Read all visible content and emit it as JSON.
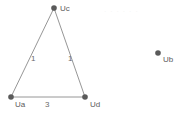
{
  "canvas": {
    "width": 188,
    "height": 117,
    "background_color": "#ffffff"
  },
  "diagram": {
    "title": "",
    "node_color": "#5a5a5a",
    "edge_color": "#8a8a8a",
    "label_color": "#5b5b5b",
    "nodes": [
      {
        "id": "Uc",
        "label": "Uc",
        "x": 54,
        "y": 8,
        "label_dx": 6,
        "label_dy": -4
      },
      {
        "id": "Ua",
        "label": "Ua",
        "x": 11,
        "y": 97,
        "label_dx": 4,
        "label_dy": 3
      },
      {
        "id": "Ud",
        "label": "Ud",
        "x": 85,
        "y": 97,
        "label_dx": 5,
        "label_dy": 3
      },
      {
        "id": "Ub",
        "label": "Ub",
        "x": 158,
        "y": 53,
        "label_dx": 5,
        "label_dy": 2
      }
    ],
    "edges": [
      {
        "from": "Ua",
        "to": "Uc",
        "label": "1",
        "label_x": 31,
        "label_y": 54
      },
      {
        "from": "Uc",
        "to": "Ud",
        "label": "1",
        "label_x": 68,
        "label_y": 54
      },
      {
        "from": "Ua",
        "to": "Ud",
        "label": "3",
        "label_x": 45,
        "label_y": 100
      }
    ]
  },
  "artifacts": {
    "watermark_text": "· · · · · ·"
  }
}
